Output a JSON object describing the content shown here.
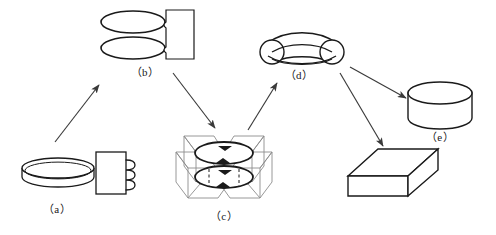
{
  "diagram": {
    "type": "process-flow",
    "title": "",
    "canvas": {
      "width": 496,
      "height": 235
    },
    "colors": {
      "stroke": "#1a1a1a",
      "stroke_light": "#8c8c8c",
      "fill": "#ffffff",
      "background": "#ffffff",
      "arrow": "#3a3a3a"
    },
    "stages": [
      {
        "id": "a",
        "label": "（a）",
        "shape": "disc-with-coil-block",
        "description": "flat cylindrical disc beside rectangle with coil winding",
        "label_x": 57,
        "label_y": 200
      },
      {
        "id": "b",
        "label": "（b）",
        "shape": "two-rings-with-block",
        "description": "two stacked elliptical rings beside notched rectangle",
        "label_x": 145,
        "label_y": 63
      },
      {
        "id": "c",
        "label": "（c）",
        "shape": "dual-ring-field-lines",
        "description": "two rings with circulation arrows and angular field planes",
        "label_x": 224,
        "label_y": 207
      },
      {
        "id": "d",
        "label": "（d）",
        "shape": "saddle-arch",
        "description": "arched saddle body with two rounded lobes",
        "label_x": 299,
        "label_y": 66
      },
      {
        "id": "e",
        "label": "（e）",
        "shape": "cylinder",
        "description": "short solid cylinder",
        "label_x": 440,
        "label_y": 128
      },
      {
        "id": "f",
        "label": "",
        "shape": "cuboid",
        "description": "isometric rectangular block",
        "label_x": 392,
        "label_y": 214
      }
    ],
    "arrows": [
      {
        "id": "a-to-b",
        "from": "a",
        "to": "b",
        "x1": 55,
        "y1": 142,
        "x2": 99,
        "y2": 85
      },
      {
        "id": "b-to-c",
        "from": "b",
        "to": "c",
        "x1": 173,
        "y1": 73,
        "x2": 215,
        "y2": 128
      },
      {
        "id": "c-to-d",
        "from": "c",
        "to": "d",
        "x1": 248,
        "y1": 130,
        "x2": 277,
        "y2": 83
      },
      {
        "id": "d-to-e",
        "from": "d",
        "to": "e",
        "x1": 350,
        "y1": 67,
        "x2": 406,
        "y2": 98
      },
      {
        "id": "d-to-f",
        "from": "d",
        "to": "f",
        "x1": 340,
        "y1": 73,
        "x2": 383,
        "y2": 146
      }
    ]
  }
}
